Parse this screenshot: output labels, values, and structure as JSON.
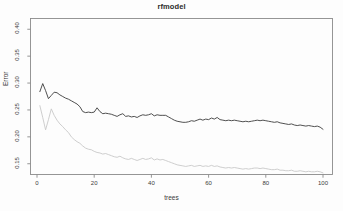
{
  "chart_data": {
    "type": "line",
    "title": "rfmodel",
    "xlabel": "trees",
    "ylabel": "Error",
    "grid": false,
    "legend": "none",
    "xlim": [
      1,
      100
    ],
    "ylim": [
      0.13,
      0.42
    ],
    "x_ticks": [
      "0",
      "20",
      "40",
      "60",
      "80",
      "100"
    ],
    "x_tick_values": [
      0,
      20,
      40,
      60,
      80,
      100
    ],
    "y_ticks": [
      "0.40",
      "0.35",
      "0.30",
      "0.25",
      "0.20",
      "0.15"
    ],
    "y_tick_values": [
      0.4,
      0.35,
      0.3,
      0.25,
      0.2,
      0.15
    ],
    "x": [
      1,
      2,
      3,
      4,
      5,
      6,
      7,
      8,
      9,
      10,
      11,
      12,
      13,
      14,
      15,
      16,
      17,
      18,
      19,
      20,
      21,
      22,
      23,
      24,
      25,
      26,
      27,
      28,
      29,
      30,
      31,
      32,
      33,
      34,
      35,
      36,
      37,
      38,
      39,
      40,
      41,
      42,
      43,
      44,
      45,
      46,
      47,
      48,
      49,
      50,
      51,
      52,
      53,
      54,
      55,
      56,
      57,
      58,
      59,
      60,
      61,
      62,
      63,
      64,
      65,
      66,
      67,
      68,
      69,
      70,
      71,
      72,
      73,
      74,
      75,
      76,
      77,
      78,
      79,
      80,
      81,
      82,
      83,
      84,
      85,
      86,
      87,
      88,
      89,
      90,
      91,
      92,
      93,
      94,
      95,
      96,
      97,
      98,
      99,
      100
    ],
    "series": [
      {
        "name": "OOB",
        "color": "#3c3c3c",
        "values": [
          0.284,
          0.299,
          0.286,
          0.271,
          0.277,
          0.283,
          0.282,
          0.278,
          0.275,
          0.272,
          0.27,
          0.267,
          0.264,
          0.261,
          0.256,
          0.247,
          0.245,
          0.246,
          0.245,
          0.246,
          0.254,
          0.247,
          0.243,
          0.244,
          0.243,
          0.242,
          0.24,
          0.238,
          0.241,
          0.243,
          0.238,
          0.239,
          0.237,
          0.238,
          0.236,
          0.239,
          0.241,
          0.24,
          0.241,
          0.243,
          0.239,
          0.241,
          0.24,
          0.24,
          0.24,
          0.237,
          0.234,
          0.231,
          0.229,
          0.228,
          0.227,
          0.227,
          0.228,
          0.23,
          0.229,
          0.231,
          0.233,
          0.231,
          0.233,
          0.232,
          0.235,
          0.233,
          0.236,
          0.232,
          0.231,
          0.23,
          0.231,
          0.23,
          0.231,
          0.23,
          0.229,
          0.228,
          0.229,
          0.228,
          0.229,
          0.23,
          0.231,
          0.23,
          0.231,
          0.23,
          0.229,
          0.228,
          0.227,
          0.228,
          0.226,
          0.225,
          0.224,
          0.223,
          0.224,
          0.222,
          0.221,
          0.222,
          0.221,
          0.22,
          0.221,
          0.22,
          0.219,
          0.22,
          0.218,
          0.214
        ]
      },
      {
        "name": "class-error",
        "color": "#c8c8c8",
        "values": [
          0.258,
          0.236,
          0.213,
          0.232,
          0.252,
          0.24,
          0.231,
          0.224,
          0.219,
          0.213,
          0.208,
          0.2,
          0.195,
          0.191,
          0.188,
          0.183,
          0.179,
          0.177,
          0.176,
          0.173,
          0.171,
          0.17,
          0.168,
          0.169,
          0.167,
          0.165,
          0.163,
          0.162,
          0.164,
          0.161,
          0.159,
          0.158,
          0.16,
          0.158,
          0.156,
          0.158,
          0.16,
          0.158,
          0.159,
          0.161,
          0.157,
          0.159,
          0.157,
          0.158,
          0.156,
          0.154,
          0.152,
          0.15,
          0.148,
          0.147,
          0.146,
          0.145,
          0.146,
          0.147,
          0.145,
          0.146,
          0.147,
          0.145,
          0.146,
          0.145,
          0.147,
          0.145,
          0.146,
          0.144,
          0.143,
          0.142,
          0.143,
          0.142,
          0.143,
          0.142,
          0.141,
          0.14,
          0.141,
          0.14,
          0.141,
          0.142,
          0.142,
          0.141,
          0.142,
          0.141,
          0.14,
          0.139,
          0.139,
          0.14,
          0.138,
          0.138,
          0.137,
          0.137,
          0.138,
          0.136,
          0.136,
          0.137,
          0.136,
          0.135,
          0.136,
          0.135,
          0.135,
          0.136,
          0.135,
          0.133
        ]
      }
    ]
  }
}
